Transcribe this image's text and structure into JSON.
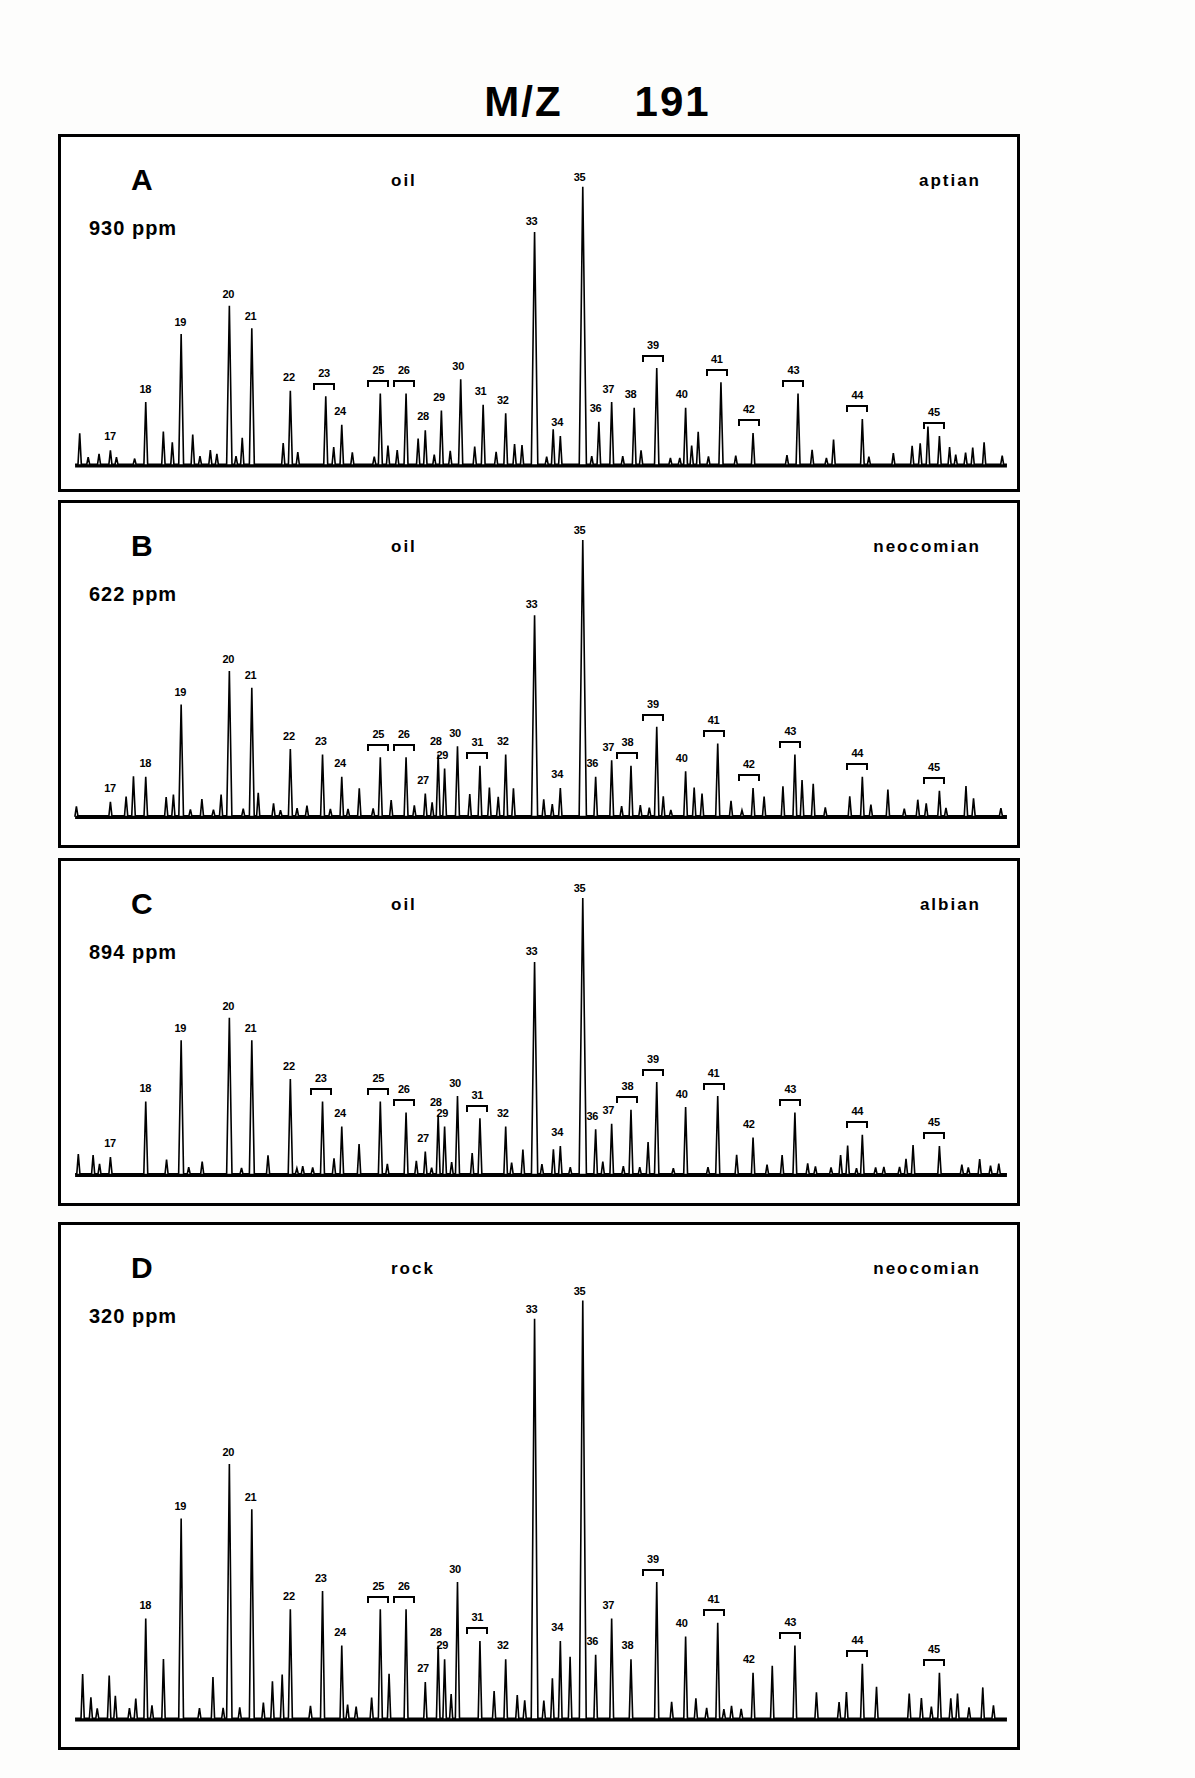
{
  "figure": {
    "title_mz": "M/Z",
    "title_value": "191"
  },
  "panels": [
    {
      "letter": "A",
      "ppm": "930 ppm",
      "sample": "oil",
      "age": "aptian"
    },
    {
      "letter": "B",
      "ppm": "622 ppm",
      "sample": "oil",
      "age": "neocomian"
    },
    {
      "letter": "C",
      "ppm": "894 ppm",
      "sample": "oil",
      "age": "albian"
    },
    {
      "letter": "D",
      "ppm": "320 ppm",
      "sample": "rock",
      "age": "neocomian"
    }
  ],
  "chart_data": {
    "type": "line",
    "xlabel": "",
    "ylabel": "",
    "grid": false,
    "legend": "none",
    "ylim": [
      0,
      100
    ],
    "note": "Four stacked m/z 191 mass chromatograms (hopane/terpane distributions). Peak numbers 17-45 annotate identified compounds; x axis is retention time (unlabelled), y axis is relative ion abundance (unlabelled).",
    "series": [
      {
        "name": "A",
        "sample": "oil",
        "age": "aptian",
        "concentration_ppm": 930,
        "labels": [
          {
            "id": "17",
            "x": 5.5,
            "h": 5,
            "bracket": false
          },
          {
            "id": "18",
            "x": 11.0,
            "h": 22,
            "bracket": false
          },
          {
            "id": "19",
            "x": 16.5,
            "h": 46,
            "bracket": false
          },
          {
            "id": "20",
            "x": 24.0,
            "h": 56,
            "bracket": false
          },
          {
            "id": "21",
            "x": 27.5,
            "h": 48,
            "bracket": false
          },
          {
            "id": "22",
            "x": 33.5,
            "h": 26,
            "bracket": false
          },
          {
            "id": "23",
            "x": 39.0,
            "h": 24,
            "bracket": true
          },
          {
            "id": "24",
            "x": 41.5,
            "h": 14,
            "bracket": false
          },
          {
            "id": "25",
            "x": 47.5,
            "h": 25,
            "bracket": true
          },
          {
            "id": "26",
            "x": 51.5,
            "h": 25,
            "bracket": true
          },
          {
            "id": "28",
            "x": 54.5,
            "h": 12,
            "bracket": false
          },
          {
            "id": "29",
            "x": 57.0,
            "h": 19,
            "bracket": false
          },
          {
            "id": "30",
            "x": 60.0,
            "h": 30,
            "bracket": false
          },
          {
            "id": "31",
            "x": 63.5,
            "h": 21,
            "bracket": false
          },
          {
            "id": "32",
            "x": 67.0,
            "h": 18,
            "bracket": false
          },
          {
            "id": "33",
            "x": 71.5,
            "h": 82,
            "bracket": false
          },
          {
            "id": "34",
            "x": 75.5,
            "h": 10,
            "bracket": false
          },
          {
            "id": "35",
            "x": 79.0,
            "h": 98,
            "bracket": false
          },
          {
            "id": "36",
            "x": 81.5,
            "h": 15,
            "bracket": false
          },
          {
            "id": "37",
            "x": 83.5,
            "h": 22,
            "bracket": false
          },
          {
            "id": "38",
            "x": 87.0,
            "h": 20,
            "bracket": false
          },
          {
            "id": "39",
            "x": 90.5,
            "h": 34,
            "bracket": true
          },
          {
            "id": "40",
            "x": 95.0,
            "h": 20,
            "bracket": false
          },
          {
            "id": "41",
            "x": 100.5,
            "h": 29,
            "bracket": true
          },
          {
            "id": "42",
            "x": 105.5,
            "h": 11,
            "bracket": true
          },
          {
            "id": "43",
            "x": 112.5,
            "h": 25,
            "bracket": true
          },
          {
            "id": "44",
            "x": 122.5,
            "h": 16,
            "bracket": true
          },
          {
            "id": "45",
            "x": 134.5,
            "h": 10,
            "bracket": true
          }
        ]
      },
      {
        "name": "B",
        "sample": "oil",
        "age": "neocomian",
        "concentration_ppm": 622,
        "labels": [
          {
            "id": "17",
            "x": 5.5,
            "h": 5,
            "bracket": false
          },
          {
            "id": "18",
            "x": 11.0,
            "h": 14,
            "bracket": false
          },
          {
            "id": "19",
            "x": 16.5,
            "h": 40,
            "bracket": false
          },
          {
            "id": "20",
            "x": 24.0,
            "h": 52,
            "bracket": false
          },
          {
            "id": "21",
            "x": 27.5,
            "h": 46,
            "bracket": false
          },
          {
            "id": "22",
            "x": 33.5,
            "h": 24,
            "bracket": false
          },
          {
            "id": "23",
            "x": 38.5,
            "h": 22,
            "bracket": false
          },
          {
            "id": "24",
            "x": 41.5,
            "h": 14,
            "bracket": false
          },
          {
            "id": "25",
            "x": 47.5,
            "h": 21,
            "bracket": true
          },
          {
            "id": "26",
            "x": 51.5,
            "h": 21,
            "bracket": true
          },
          {
            "id": "27",
            "x": 54.5,
            "h": 8,
            "bracket": false
          },
          {
            "id": "28",
            "x": 56.5,
            "h": 22,
            "bracket": false
          },
          {
            "id": "29",
            "x": 57.5,
            "h": 17,
            "bracket": false
          },
          {
            "id": "30",
            "x": 59.5,
            "h": 25,
            "bracket": false
          },
          {
            "id": "31",
            "x": 63.0,
            "h": 18,
            "bracket": true
          },
          {
            "id": "32",
            "x": 67.0,
            "h": 22,
            "bracket": false
          },
          {
            "id": "33",
            "x": 71.5,
            "h": 72,
            "bracket": false
          },
          {
            "id": "34",
            "x": 75.5,
            "h": 10,
            "bracket": false
          },
          {
            "id": "35",
            "x": 79.0,
            "h": 99,
            "bracket": false
          },
          {
            "id": "36",
            "x": 81.0,
            "h": 14,
            "bracket": false
          },
          {
            "id": "37",
            "x": 83.5,
            "h": 20,
            "bracket": false
          },
          {
            "id": "38",
            "x": 86.5,
            "h": 18,
            "bracket": true
          },
          {
            "id": "39",
            "x": 90.5,
            "h": 32,
            "bracket": true
          },
          {
            "id": "40",
            "x": 95.0,
            "h": 16,
            "bracket": false
          },
          {
            "id": "41",
            "x": 100.0,
            "h": 26,
            "bracket": true
          },
          {
            "id": "42",
            "x": 105.5,
            "h": 10,
            "bracket": true
          },
          {
            "id": "43",
            "x": 112.0,
            "h": 22,
            "bracket": true
          },
          {
            "id": "44",
            "x": 122.5,
            "h": 14,
            "bracket": true
          },
          {
            "id": "45",
            "x": 134.5,
            "h": 9,
            "bracket": true
          }
        ]
      },
      {
        "name": "C",
        "sample": "oil",
        "age": "albian",
        "concentration_ppm": 894,
        "labels": [
          {
            "id": "17",
            "x": 5.5,
            "h": 6,
            "bracket": false
          },
          {
            "id": "18",
            "x": 11.0,
            "h": 26,
            "bracket": false
          },
          {
            "id": "19",
            "x": 16.5,
            "h": 48,
            "bracket": false
          },
          {
            "id": "20",
            "x": 24.0,
            "h": 56,
            "bracket": false
          },
          {
            "id": "21",
            "x": 27.5,
            "h": 48,
            "bracket": false
          },
          {
            "id": "22",
            "x": 33.5,
            "h": 34,
            "bracket": false
          },
          {
            "id": "23",
            "x": 38.5,
            "h": 26,
            "bracket": true
          },
          {
            "id": "24",
            "x": 41.5,
            "h": 17,
            "bracket": false
          },
          {
            "id": "25",
            "x": 47.5,
            "h": 26,
            "bracket": true
          },
          {
            "id": "26",
            "x": 51.5,
            "h": 22,
            "bracket": true
          },
          {
            "id": "27",
            "x": 54.5,
            "h": 8,
            "bracket": false
          },
          {
            "id": "28",
            "x": 56.5,
            "h": 21,
            "bracket": false
          },
          {
            "id": "29",
            "x": 57.5,
            "h": 17,
            "bracket": false
          },
          {
            "id": "30",
            "x": 59.5,
            "h": 28,
            "bracket": false
          },
          {
            "id": "31",
            "x": 63.0,
            "h": 20,
            "bracket": true
          },
          {
            "id": "32",
            "x": 67.0,
            "h": 17,
            "bracket": false
          },
          {
            "id": "33",
            "x": 71.5,
            "h": 76,
            "bracket": false
          },
          {
            "id": "34",
            "x": 75.5,
            "h": 10,
            "bracket": false
          },
          {
            "id": "35",
            "x": 79.0,
            "h": 99,
            "bracket": false
          },
          {
            "id": "36",
            "x": 81.0,
            "h": 16,
            "bracket": false
          },
          {
            "id": "37",
            "x": 83.5,
            "h": 18,
            "bracket": false
          },
          {
            "id": "38",
            "x": 86.5,
            "h": 23,
            "bracket": true
          },
          {
            "id": "39",
            "x": 90.5,
            "h": 33,
            "bracket": true
          },
          {
            "id": "40",
            "x": 95.0,
            "h": 24,
            "bracket": false
          },
          {
            "id": "41",
            "x": 100.0,
            "h": 28,
            "bracket": true
          },
          {
            "id": "42",
            "x": 105.5,
            "h": 13,
            "bracket": false
          },
          {
            "id": "43",
            "x": 112.0,
            "h": 22,
            "bracket": true
          },
          {
            "id": "44",
            "x": 122.5,
            "h": 14,
            "bracket": true
          },
          {
            "id": "45",
            "x": 134.5,
            "h": 10,
            "bracket": true
          }
        ]
      },
      {
        "name": "D",
        "sample": "rock",
        "age": "neocomian",
        "concentration_ppm": 320,
        "labels": [
          {
            "id": "18",
            "x": 11.0,
            "h": 22,
            "bracket": false
          },
          {
            "id": "19",
            "x": 16.5,
            "h": 44,
            "bracket": false
          },
          {
            "id": "20",
            "x": 24.0,
            "h": 56,
            "bracket": false
          },
          {
            "id": "21",
            "x": 27.5,
            "h": 46,
            "bracket": false
          },
          {
            "id": "22",
            "x": 33.5,
            "h": 24,
            "bracket": false
          },
          {
            "id": "23",
            "x": 38.5,
            "h": 28,
            "bracket": false
          },
          {
            "id": "24",
            "x": 41.5,
            "h": 16,
            "bracket": false
          },
          {
            "id": "25",
            "x": 47.5,
            "h": 24,
            "bracket": true
          },
          {
            "id": "26",
            "x": 51.5,
            "h": 24,
            "bracket": true
          },
          {
            "id": "27",
            "x": 54.5,
            "h": 8,
            "bracket": false
          },
          {
            "id": "28",
            "x": 56.5,
            "h": 16,
            "bracket": false
          },
          {
            "id": "29",
            "x": 57.5,
            "h": 13,
            "bracket": false
          },
          {
            "id": "30",
            "x": 59.5,
            "h": 30,
            "bracket": false
          },
          {
            "id": "31",
            "x": 63.0,
            "h": 17,
            "bracket": true
          },
          {
            "id": "32",
            "x": 67.0,
            "h": 13,
            "bracket": false
          },
          {
            "id": "33",
            "x": 71.5,
            "h": 88,
            "bracket": false
          },
          {
            "id": "34",
            "x": 75.5,
            "h": 17,
            "bracket": false
          },
          {
            "id": "35",
            "x": 79.0,
            "h": 92,
            "bracket": false
          },
          {
            "id": "36",
            "x": 81.0,
            "h": 14,
            "bracket": false
          },
          {
            "id": "37",
            "x": 83.5,
            "h": 22,
            "bracket": false
          },
          {
            "id": "38",
            "x": 86.5,
            "h": 13,
            "bracket": false
          },
          {
            "id": "39",
            "x": 90.5,
            "h": 30,
            "bracket": true
          },
          {
            "id": "40",
            "x": 95.0,
            "h": 18,
            "bracket": false
          },
          {
            "id": "41",
            "x": 100.0,
            "h": 21,
            "bracket": true
          },
          {
            "id": "42",
            "x": 105.5,
            "h": 10,
            "bracket": false
          },
          {
            "id": "43",
            "x": 112.0,
            "h": 16,
            "bracket": true
          },
          {
            "id": "44",
            "x": 122.5,
            "h": 12,
            "bracket": true
          },
          {
            "id": "45",
            "x": 134.5,
            "h": 10,
            "bracket": true
          }
        ]
      }
    ]
  }
}
